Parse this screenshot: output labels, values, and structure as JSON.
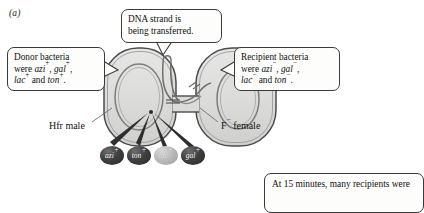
{
  "figure": {
    "panel_label": "(a)",
    "background": "#ffffff"
  },
  "callouts": {
    "dna": {
      "name": "dna-transfer-callout",
      "line1": "DNA strand is",
      "line2": "being transferred."
    },
    "donor": {
      "name": "donor-bacteria-callout",
      "line1": "Donor bacteria",
      "line2_pre": "were ",
      "line2_gene1": "azi",
      "line2_sup1": "+",
      "line2_mid": ", ",
      "line2_gene2": "gal",
      "line2_sup2": "+",
      "line2_post": ",",
      "line3_gene3": "lac",
      "line3_sup3": "+",
      "line3_mid": " and ",
      "line3_gene4": "ton",
      "line3_sup4": "+",
      "line3_post": "."
    },
    "recipient": {
      "name": "recipient-bacteria-callout",
      "line1": "Recipient bacteria",
      "line2_pre": "were ",
      "line2_gene1": "azi",
      "line2_sup1": "−",
      "line2_mid": ", ",
      "line2_gene2": "gal",
      "line2_sup2": "−",
      "line2_post": ",",
      "line3_gene3": "lac",
      "line3_sup3": "−",
      "line3_mid": " and ",
      "line3_gene4": "ton",
      "line3_sup4": "−",
      "line3_post": "."
    },
    "bottom": {
      "name": "fifteen-minutes-callout",
      "line1": "At 15 minutes, many recipients were"
    }
  },
  "cells": {
    "donor_label": "Hfr male",
    "recipient_label_base": "F",
    "recipient_label_sup": "−",
    "recipient_label_rest": " female",
    "donor_fill": "#dcdcda",
    "recipient_fill": "#dcdcda",
    "membrane_stroke": "#4a4a4a",
    "chromosome_stroke": "#7a7a7a"
  },
  "genes": [
    {
      "label": "azi",
      "sup": "+",
      "shade": "dark",
      "name": "gene-marker-azi"
    },
    {
      "label": "ton",
      "sup": "+",
      "shade": "dark",
      "name": "gene-marker-ton"
    },
    {
      "label": "lac",
      "sup": "+",
      "shade": "light",
      "name": "gene-marker-lac"
    },
    {
      "label": "gal",
      "sup": "+",
      "shade": "dark",
      "name": "gene-marker-gal"
    }
  ]
}
